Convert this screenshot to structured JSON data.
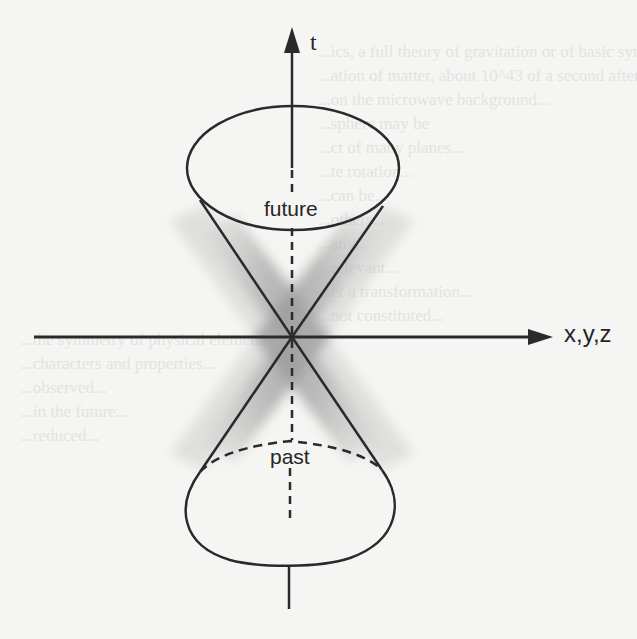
{
  "figure": {
    "type": "light-cone",
    "labels": {
      "time_axis": "t",
      "space_axis": "x,y,z",
      "future_cone": "future",
      "past_cone": "past"
    },
    "colors": {
      "line": "#2a2a2a",
      "shadow": "#9a9a9a",
      "paper": "#f5f5f3"
    }
  },
  "background_bleed_text": [
    "...ics, a full theory of gravitation or of basic symmetry",
    "...ation of matter, about 10^43 of a second after the",
    "...on the microwave background...",
    "...sphere may be",
    "...ct of many planes...",
    "...te rotation...",
    "...can be...",
    "...others...",
    "...any...",
    "...relevant...",
    "...er a transformation...",
    "...not constituted...",
    "...the symmetry of physical elements...",
    "...characters and properties...",
    "...observed...",
    "...in the future...",
    "...reduced..."
  ]
}
